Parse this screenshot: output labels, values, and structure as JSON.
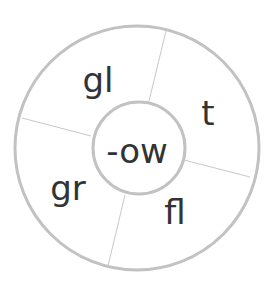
{
  "wheel": {
    "center": "-ow",
    "segments": [
      {
        "label": "gl"
      },
      {
        "label": "t"
      },
      {
        "label": "fl"
      },
      {
        "label": "gr"
      }
    ],
    "stroke_color": "#c2c2c2",
    "text_color": "#333333"
  }
}
